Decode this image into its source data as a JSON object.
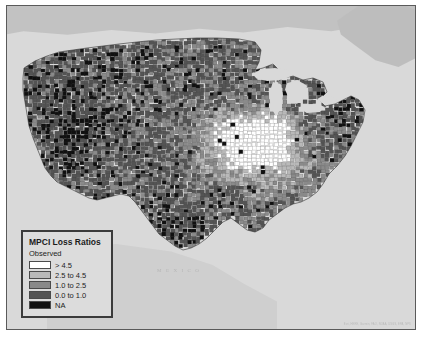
{
  "map": {
    "title": "MPCI Loss Ratios by county, contiguous United States",
    "country_labels": {
      "mexico": "M E X I C O"
    },
    "attribution": "Esri, HERE, Garmin, FAO, NOAA, USGS, EPA, NPS",
    "colors": {
      "ocean": "#d9d9d9",
      "canada": "#c2c2c2",
      "mexico_land": "#cfcfcf",
      "frame_border": "#5a5a5a",
      "page_background": "#ffffff"
    }
  },
  "legend": {
    "title": "MPCI Loss Ratios",
    "subtitle": "Observed",
    "items": [
      {
        "label": "> 4.5",
        "color": "#ffffff"
      },
      {
        "label": "2.5 to 4.5",
        "color": "#b9b9b9"
      },
      {
        "label": "1.0 to 2.5",
        "color": "#8a8a8a"
      },
      {
        "label": "0.0 to 1.0",
        "color": "#545454"
      },
      {
        "label": "NA",
        "color": "#101010"
      }
    ],
    "box_color": "#dcdcdc",
    "border_color": "#3b3b3b"
  },
  "chart_data": {
    "type": "heatmap",
    "title": "MPCI Loss Ratios",
    "subtitle": "Observed",
    "xlabel": "",
    "ylabel": "",
    "legend_position": "bottom-left",
    "grid": false,
    "categories": [
      "> 4.5",
      "2.5 to 4.5",
      "1.0 to 2.5",
      "0.0 to 1.0",
      "NA"
    ],
    "values": [
      1,
      2,
      3,
      4,
      0
    ],
    "colors": [
      "#ffffff",
      "#b9b9b9",
      "#8a8a8a",
      "#545454",
      "#101010"
    ],
    "regions": [
      {
        "name": "Pacific Northwest",
        "dominant_class": "0.0 to 1.0"
      },
      {
        "name": "Great Basin / Nevada",
        "dominant_class": "NA"
      },
      {
        "name": "Northern Plains",
        "dominant_class": "0.0 to 1.0"
      },
      {
        "name": "Corn Belt (Iowa / Illinois)",
        "dominant_class": "> 4.5"
      },
      {
        "name": "Central Plains (Kansas / Nebraska)",
        "dominant_class": "2.5 to 4.5"
      },
      {
        "name": "Texas",
        "dominant_class": "0.0 to 1.0"
      },
      {
        "name": "Mississippi Delta",
        "dominant_class": "1.0 to 2.5"
      },
      {
        "name": "Southeast",
        "dominant_class": "0.0 to 1.0"
      },
      {
        "name": "Northeast",
        "dominant_class": "NA"
      }
    ]
  }
}
